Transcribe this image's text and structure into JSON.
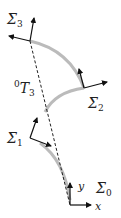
{
  "figure": {
    "type": "kinematic-chain-diagram",
    "colors": {
      "link": "#bbbbbb",
      "axis": "#111111",
      "dashed": "#222222"
    },
    "frames": [
      {
        "id": "frame-0",
        "label": "Σ",
        "subscript": "0"
      },
      {
        "id": "frame-1",
        "label": "Σ",
        "subscript": "1"
      },
      {
        "id": "frame-2",
        "label": "Σ",
        "subscript": "2"
      },
      {
        "id": "frame-3",
        "label": "Σ",
        "subscript": "3"
      }
    ],
    "axes": {
      "x": "x",
      "y": "y"
    },
    "transform": {
      "superscript": "0",
      "symbol": "T",
      "subscript": "3"
    }
  }
}
